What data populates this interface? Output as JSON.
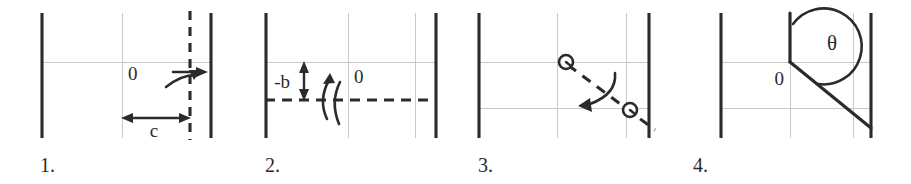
{
  "figure": {
    "background_color": "#ffffff",
    "line_color": "#2b2b2b",
    "grid_color": "#c9c9c9",
    "panel_count": 4
  },
  "panels": [
    {
      "id": "panel-1",
      "number_label": "1.",
      "labels": {
        "origin": "0",
        "dimension": "c"
      },
      "elements": {
        "left_wall": "solid vertical line",
        "right_wall": "solid vertical line",
        "center_gridline": "thin vertical gridline",
        "horizontal_gridline": "thin horizontal gridline",
        "dashed_vertical": "heavy dashed vertical line",
        "translation_arrow": "right-pointing arrow",
        "rotation_arc": "curved arrow",
        "dimension_arrow": "double-headed horizontal arrow labeled c"
      }
    },
    {
      "id": "panel-2",
      "number_label": "2.",
      "labels": {
        "origin": "0",
        "dimension": "-b"
      },
      "elements": {
        "left_wall": "solid vertical line",
        "right_wall": "solid vertical line",
        "center_gridline": "thin vertical gridline",
        "right_gridline": "thin vertical gridline",
        "horizontal_gridline": "thin horizontal gridline",
        "dashed_horizontal": "heavy dashed horizontal line",
        "dimension_arrow": "double-headed vertical arrow labeled -b",
        "rotation_arc": "curved arrow pointing up"
      }
    },
    {
      "id": "panel-3",
      "number_label": "3.",
      "labels": {},
      "elements": {
        "left_wall": "solid vertical line",
        "right_wall": "solid vertical line",
        "center_gridline": "thin vertical gridline",
        "right_gridline": "thin vertical gridline",
        "upper_gridline": "thin horizontal gridline",
        "lower_gridline": "thin horizontal gridline",
        "dashed_diagonal": "heavy dashed diagonal line",
        "node_upper": "small open circle marker",
        "node_lower": "small open circle marker",
        "rotation_arc": "curved arrow pointing down-left"
      }
    },
    {
      "id": "panel-4",
      "number_label": "4.",
      "labels": {
        "origin": "0",
        "angle": "θ"
      },
      "elements": {
        "left_wall": "solid vertical line",
        "right_wall": "solid vertical line",
        "center_gridline": "thin vertical gridline",
        "right_gridline": "thin vertical gridline",
        "upper_gridline": "thin horizontal gridline",
        "lower_gridline": "thin horizontal gridline",
        "vertical_arm": "solid vertical segment above origin",
        "diagonal_arm": "solid diagonal segment from origin to lower right",
        "angle_arc": "arc spanning from vertical arm to diagonal arm labeled theta"
      }
    }
  ]
}
